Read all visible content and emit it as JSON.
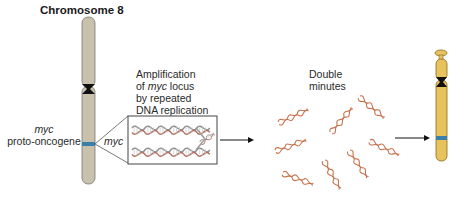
{
  "diagram": {
    "title": "Chromosome 8",
    "labels": {
      "proto_oncogene_italic": "myc",
      "proto_oncogene": "proto-oncogene",
      "locus": "myc",
      "amplification_line1": "Amplification",
      "amplification_line2_prefix": "of ",
      "amplification_line2_italic": "myc",
      "amplification_line2_suffix": " locus",
      "amplification_line3": "by repeated",
      "amplification_line4": "DNA replication",
      "double_minutes_line1": "Double",
      "double_minutes_line2": "minutes"
    },
    "colors": {
      "normal_chromosome": "#c9c1ab",
      "amplified_chromosome": "#e8c25a",
      "centromere": "#111111",
      "myc_band": "#3a7fa8",
      "dna_strand": "#c8704a",
      "helix_gray": "#9a9a9a",
      "arrow": "#111111"
    },
    "elements": [
      "normal chromosome 8 with myc band",
      "zoomed box showing amplified DNA replication",
      "arrow to double minutes",
      "eight double-minute DNA fragments",
      "arrow to chromosome with amplified region"
    ]
  }
}
